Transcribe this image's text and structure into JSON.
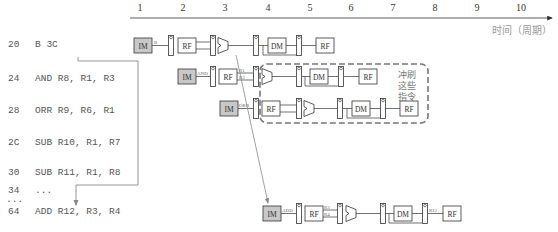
{
  "timeline": {
    "cycles": [
      "1",
      "2",
      "3",
      "4",
      "5",
      "6",
      "7",
      "8",
      "9",
      "10"
    ],
    "axis_label": "时间（周期）"
  },
  "program": [
    {
      "addr": "20",
      "instr": "B 3C"
    },
    {
      "addr": "24",
      "instr": "AND R8, R1, R3"
    },
    {
      "addr": "28",
      "instr": "ORR R9, R6, R1"
    },
    {
      "addr": "2C",
      "instr": "SUB R10, R1, R7"
    },
    {
      "addr": "30",
      "instr": "SUB R11, R1, R8"
    },
    {
      "addr": "34",
      "instr": "..."
    },
    {
      "addr": "...",
      "instr": ""
    },
    {
      "addr": "64",
      "instr": "ADD R12, R3, R4"
    }
  ],
  "pipeline": {
    "stages": {
      "fetch": "IM",
      "decode": "RF",
      "memory": "DM",
      "writeback": "RF"
    },
    "rows": [
      {
        "op": "B",
        "src1": "",
        "src2": "",
        "dest": ""
      },
      {
        "op": "AND",
        "src1": "R1",
        "src2": "R3",
        "dest": ""
      },
      {
        "op": "ORR",
        "src1": "",
        "src2": "",
        "dest": ""
      },
      {
        "op": "ADD",
        "src1": "R3",
        "src2": "R4",
        "dest": "R12"
      }
    ]
  },
  "flush_note": {
    "line1": "冲刷",
    "line2": "这些",
    "line3": "指令"
  },
  "colors": {
    "im_fill": "#c8c8c8",
    "line": "#333333",
    "flush_border": "#777777",
    "arrow": "#888888"
  }
}
